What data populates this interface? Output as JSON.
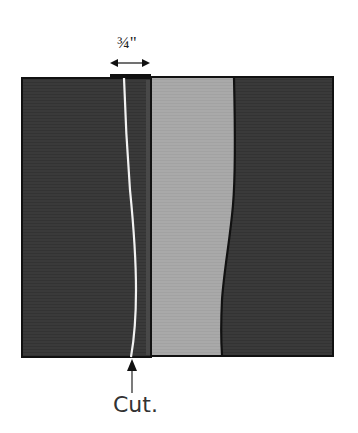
{
  "diagram": {
    "measurement_label": "3/4\"",
    "measurement_display": "¾\"",
    "cut_label": "Cut.",
    "colors": {
      "dark_fabric": "#3a3a3a",
      "light_fabric": "#a9a9a9",
      "outline": "#111111",
      "cut_line": "#f2f2f2",
      "background": "#ffffff"
    },
    "parts": [
      {
        "name": "left-dark-panel"
      },
      {
        "name": "center-light-strip"
      },
      {
        "name": "right-dark-panel"
      },
      {
        "name": "seam-allowance-tab"
      },
      {
        "name": "cut-line"
      },
      {
        "name": "measurement-arrow"
      },
      {
        "name": "cut-pointer-arrow"
      }
    ]
  }
}
